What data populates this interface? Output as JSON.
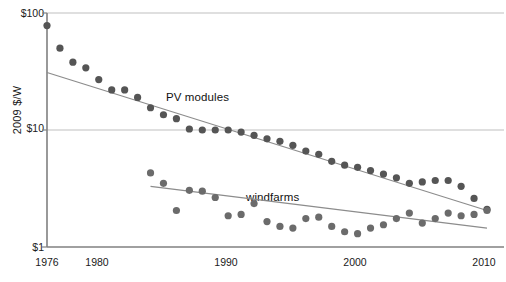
{
  "chart_data": {
    "type": "scatter",
    "title": "",
    "xlabel": "",
    "ylabel": "2009 $/W",
    "xlim": [
      1976,
      2010
    ],
    "ylim": [
      1,
      100
    ],
    "yscale": "log",
    "grid": "horizontal-at-yticks",
    "legend": "inline-annotations",
    "xticks": [
      1976,
      1980,
      1990,
      2000,
      2010
    ],
    "xtick_labels": [
      "1976",
      "1980",
      "1990",
      "2000",
      "2010"
    ],
    "yticks": [
      1,
      10,
      100
    ],
    "ytick_labels": [
      "$1",
      "$10",
      "$100"
    ],
    "series": [
      {
        "name": "PV modules",
        "color": "#555555",
        "annotation": "PV modules",
        "trendline": {
          "x0": 1976,
          "y0": 31.0,
          "x1": 2010,
          "y1": 2.05
        },
        "x": [
          1976,
          1977,
          1978,
          1979,
          1980,
          1981,
          1982,
          1983,
          1984,
          1985,
          1986,
          1987,
          1988,
          1989,
          1990,
          1991,
          1992,
          1993,
          1994,
          1995,
          1996,
          1997,
          1998,
          1999,
          2000,
          2001,
          2002,
          2003,
          2004,
          2005,
          2006,
          2007,
          2008,
          2009,
          2010
        ],
        "y": [
          78.0,
          50.0,
          38.0,
          34.0,
          27.0,
          22.0,
          22.0,
          19.0,
          15.5,
          13.5,
          12.5,
          10.2,
          10.0,
          10.0,
          10.0,
          9.6,
          9.0,
          8.4,
          8.0,
          7.4,
          6.6,
          6.2,
          5.4,
          5.0,
          4.8,
          4.5,
          4.2,
          3.9,
          3.5,
          3.6,
          3.7,
          3.7,
          3.3,
          2.6,
          2.1
        ]
      },
      {
        "name": "windfarms",
        "color": "#6b6b6b",
        "annotation": "windfarms",
        "trendline": {
          "x0": 1984,
          "y0": 3.3,
          "x1": 2010,
          "y1": 1.45
        },
        "x": [
          1984,
          1985,
          1986,
          1987,
          1988,
          1989,
          1990,
          1991,
          1992,
          1993,
          1994,
          1995,
          1996,
          1997,
          1998,
          1999,
          2000,
          2001,
          2002,
          2003,
          2004,
          2005,
          2006,
          2007,
          2008,
          2009,
          2010
        ],
        "y": [
          4.3,
          3.5,
          2.05,
          3.05,
          3.0,
          2.65,
          1.85,
          1.9,
          2.35,
          1.65,
          1.5,
          1.45,
          1.75,
          1.8,
          1.5,
          1.35,
          1.3,
          1.45,
          1.55,
          1.75,
          1.95,
          1.6,
          1.75,
          1.95,
          1.85,
          1.9,
          2.05
        ]
      }
    ]
  },
  "axis": {
    "ylabel": "2009 $/W",
    "ytick_top": "$100",
    "ytick_mid": "$10",
    "ytick_bottom": "$1",
    "xtick_1976": "1976",
    "xtick_1980": "1980",
    "xtick_1990": "1990",
    "xtick_2000": "2000",
    "xtick_2010": "2010"
  },
  "annotations": {
    "pv_label": "PV modules",
    "wind_label": "windfarms"
  },
  "colors": {
    "dot": "#555555",
    "wind_dot": "#6b6b6b",
    "axis": "#808080",
    "grid": "#bfbfbf",
    "trend": "#8c8c8c",
    "text": "#1a1a1a",
    "background": "#ffffff"
  }
}
